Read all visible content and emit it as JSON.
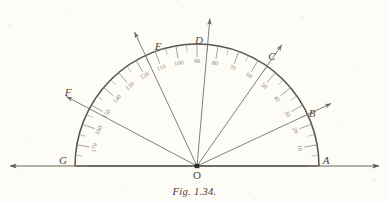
{
  "figure": {
    "caption": "Fig. 1.34.",
    "type": "protractor-diagram",
    "center_label": "O",
    "geometry": {
      "center_x": 197,
      "center_y": 166,
      "outer_radius": 122,
      "scale_ring_radius": 104,
      "baseline_y": 166,
      "baseline_left_x": 10,
      "baseline_right_x": 379
    },
    "colors": {
      "background": "#fdfcf6",
      "ink": "#57544c",
      "ray": "#6d6a62",
      "scale": "#8d8a80",
      "label": "#3d3a34"
    },
    "points": [
      {
        "label": "A",
        "angle_deg": 0,
        "x": 326,
        "y": 164,
        "has_ray": false
      },
      {
        "label": "B",
        "angle_deg": 25,
        "x": 312,
        "y": 117,
        "has_ray": true
      },
      {
        "label": "C",
        "angle_deg": 55,
        "x": 272,
        "y": 60,
        "has_ray": true
      },
      {
        "label": "D",
        "angle_deg": 85,
        "x": 199,
        "y": 44,
        "has_ray": true
      },
      {
        "label": "E",
        "angle_deg": 115,
        "x": 158,
        "y": 50,
        "has_ray": true
      },
      {
        "label": "F",
        "angle_deg": 152,
        "x": 68,
        "y": 96,
        "has_ray": true
      },
      {
        "label": "G",
        "angle_deg": 180,
        "x": 63,
        "y": 164,
        "has_ray": false
      }
    ],
    "degree_labels": [
      {
        "value": "10",
        "angle_deg": 10
      },
      {
        "value": "20",
        "angle_deg": 20
      },
      {
        "value": "30",
        "angle_deg": 30
      },
      {
        "value": "40",
        "angle_deg": 40
      },
      {
        "value": "50",
        "angle_deg": 50
      },
      {
        "value": "60",
        "angle_deg": 60
      },
      {
        "value": "70",
        "angle_deg": 70
      },
      {
        "value": "80",
        "angle_deg": 80
      },
      {
        "value": "90",
        "angle_deg": 90
      },
      {
        "value": "100",
        "angle_deg": 100
      },
      {
        "value": "110",
        "angle_deg": 110
      },
      {
        "value": "120",
        "angle_deg": 120
      },
      {
        "value": "130",
        "angle_deg": 130
      },
      {
        "value": "140",
        "angle_deg": 140
      },
      {
        "value": "150",
        "angle_deg": 150
      },
      {
        "value": "160",
        "angle_deg": 160
      },
      {
        "value": "170",
        "angle_deg": 170
      }
    ]
  }
}
